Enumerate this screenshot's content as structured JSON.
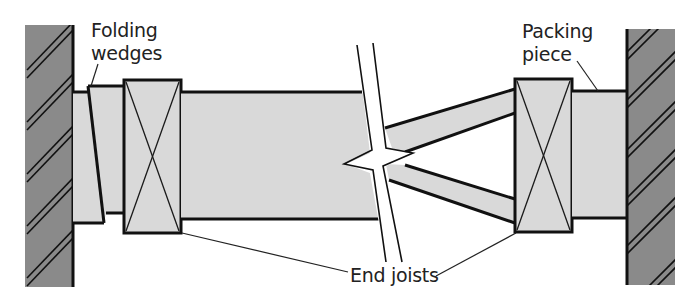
{
  "diagram": {
    "labels": {
      "folding_wedges_line1": "Folding",
      "folding_wedges_line2": "wedges",
      "packing_piece_line1": "Packing",
      "packing_piece_line2": "piece",
      "end_joists": "End joists"
    },
    "components": [
      {
        "id": "left-wall",
        "type": "wall",
        "hatched": true
      },
      {
        "id": "folding-wedges",
        "type": "wedge-pair"
      },
      {
        "id": "left-end-joist",
        "type": "end-joist",
        "cross_marked": true
      },
      {
        "id": "main-beam",
        "type": "horizontal-strut"
      },
      {
        "id": "break-line",
        "type": "break-symbol"
      },
      {
        "id": "upper-raking-strut",
        "type": "raking-strut"
      },
      {
        "id": "lower-raking-strut",
        "type": "raking-strut"
      },
      {
        "id": "right-end-joist",
        "type": "end-joist",
        "cross_marked": true
      },
      {
        "id": "packing-piece",
        "type": "packing"
      },
      {
        "id": "right-wall",
        "type": "wall",
        "hatched": true
      }
    ],
    "colors": {
      "wall_fill": "#8a8a8a",
      "timber_fill": "#d9d9d9",
      "outline": "#111111",
      "background": "#ffffff"
    }
  }
}
